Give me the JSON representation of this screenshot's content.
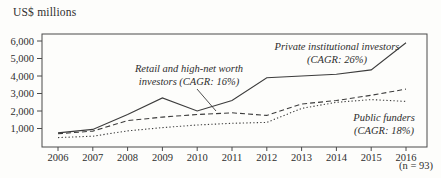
{
  "chart_data": {
    "type": "line",
    "ylabel": "US$ millions",
    "footnote": "(n = 93)",
    "x": [
      2006,
      2007,
      2008,
      2009,
      2010,
      2011,
      2012,
      2013,
      2014,
      2015,
      2016
    ],
    "yticks": [
      1000,
      2000,
      3000,
      4000,
      5000,
      6000
    ],
    "ytick_labels": [
      "1,000",
      "2,000",
      "3,000",
      "4,000",
      "5,000",
      "6,000"
    ],
    "ylim": [
      0,
      6400
    ],
    "grid": false,
    "legend_position": "inline-annotations",
    "series": [
      {
        "name": "Private institutional investors",
        "cagr": "26%",
        "style": "solid",
        "label_lines": [
          "Private institutional investors",
          "(CAGR: 26%)"
        ],
        "values": [
          750,
          950,
          1800,
          2750,
          2000,
          2600,
          3900,
          4000,
          4100,
          4350,
          5900
        ]
      },
      {
        "name": "Retail and high-net worth investors",
        "cagr": "16%",
        "style": "dashed",
        "label_lines": [
          "Retail and high-net worth",
          "investors (CAGR: 16%)"
        ],
        "values": [
          700,
          850,
          1450,
          1650,
          1800,
          1900,
          1750,
          2400,
          2600,
          2900,
          3250
        ]
      },
      {
        "name": "Public funders",
        "cagr": "18%",
        "style": "dotted",
        "label_lines": [
          "Public funders",
          "(CAGR: 18%)"
        ],
        "values": [
          480,
          560,
          860,
          1050,
          1200,
          1300,
          1350,
          2150,
          2500,
          2650,
          2550
        ]
      }
    ]
  }
}
